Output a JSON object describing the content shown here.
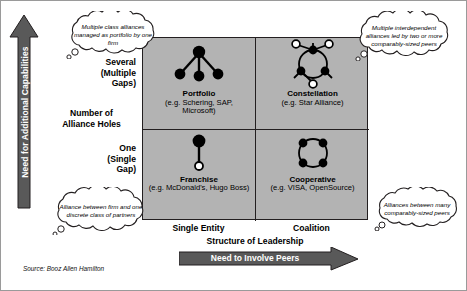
{
  "diagram": {
    "y_axis": {
      "arrow_label": "Need for Additional Capabilities",
      "title": "Number of\nAlliance Holes",
      "title_line1": "Number of",
      "title_line2": "Alliance Holes",
      "top_label_line1": "Several",
      "top_label_line2": "(Multiple",
      "top_label_line3": "Gaps)",
      "bottom_label_line1": "One",
      "bottom_label_line2": "(Single",
      "bottom_label_line3": "Gap)"
    },
    "x_axis": {
      "arrow_label": "Need to Involve Peers",
      "title": "Structure of Leadership",
      "left_label": "Single Entity",
      "right_label": "Coalition"
    },
    "quadrants": [
      {
        "key": "portfolio",
        "name": "Portfolio",
        "examples_line1": "(e.g. Schering, SAP,",
        "examples_line2": "Microsoft)",
        "glyph": "hub-and-spoke-three-children"
      },
      {
        "key": "constellation",
        "name": "Constellation",
        "examples_line1": "(e.g. Star Alliance)",
        "examples_line2": "",
        "glyph": "ring-three-filled-three-hollow"
      },
      {
        "key": "franchise",
        "name": "Franchise",
        "examples_line1": "(e.g. McDonald's, Hugo Boss)",
        "examples_line2": "",
        "glyph": "one-large-filled-one-small-hollow"
      },
      {
        "key": "cooperative",
        "name": "Cooperative",
        "examples_line1": "(e.g. VISA, OpenSource)",
        "examples_line2": "",
        "glyph": "ring-four-filled"
      }
    ],
    "callouts": {
      "top_left": "Multiple class alliances managed as portfolio by one firm",
      "top_right": "Multiple interdependent alliances led by two or more comparably-sized peers",
      "bottom_left": "Alliance between firm and one discrete class of partners",
      "bottom_right": "Alliances between many comparably-sized peers"
    },
    "source": "Source: Booz Allen Hamilton",
    "colors": {
      "matrix_fill": "#b3b3b3",
      "arrow_fill": "#595959",
      "line": "#231f20",
      "node_filled": "#000000",
      "node_hollow": "#ffffff"
    }
  }
}
